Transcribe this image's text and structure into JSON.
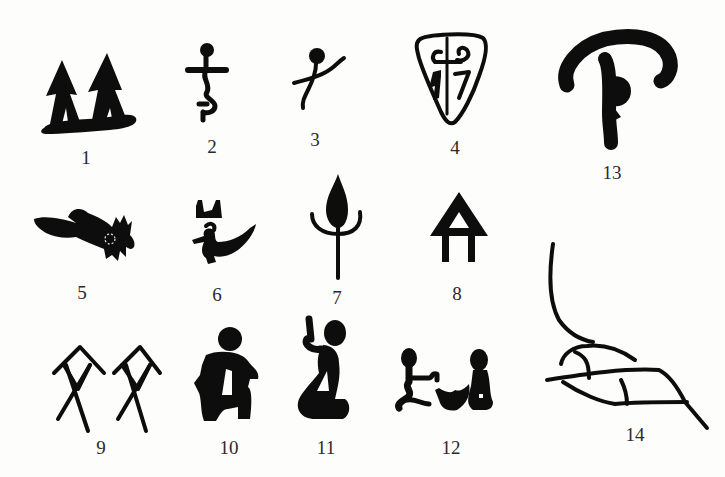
{
  "figure": {
    "ink_color": "#0d0d0d",
    "background_color": "#fdfdfc",
    "items": [
      {
        "number": "1",
        "icon": "twin-trees-icon",
        "label_x": 86,
        "label_y": 148
      },
      {
        "number": "2",
        "icon": "stick-figure-icon",
        "label_x": 212,
        "label_y": 137
      },
      {
        "number": "3",
        "icon": "dancing-figure-icon",
        "label_x": 315,
        "label_y": 130
      },
      {
        "number": "4",
        "icon": "shield-emblem-icon",
        "label_x": 455,
        "label_y": 138
      },
      {
        "number": "5",
        "icon": "animal-head-icon",
        "label_x": 82,
        "label_y": 283
      },
      {
        "number": "6",
        "icon": "bird-icon",
        "label_x": 217,
        "label_y": 285
      },
      {
        "number": "7",
        "icon": "flame-plant-icon",
        "label_x": 337,
        "label_y": 288
      },
      {
        "number": "8",
        "icon": "triangle-house-icon",
        "label_x": 457,
        "label_y": 284
      },
      {
        "number": "9",
        "icon": "paired-figures-icon",
        "label_x": 101,
        "label_y": 438
      },
      {
        "number": "10",
        "icon": "squatting-figure-icon",
        "label_x": 229,
        "label_y": 438
      },
      {
        "number": "11",
        "icon": "kneeling-figure-icon",
        "label_x": 326,
        "label_y": 438
      },
      {
        "number": "12",
        "icon": "facing-figures-icon",
        "label_x": 451,
        "label_y": 438
      },
      {
        "number": "13",
        "icon": "hooked-symbol-icon",
        "label_x": 612,
        "label_y": 163
      },
      {
        "number": "14",
        "icon": "leaf-branch-icon",
        "label_x": 635,
        "label_y": 425
      }
    ]
  }
}
